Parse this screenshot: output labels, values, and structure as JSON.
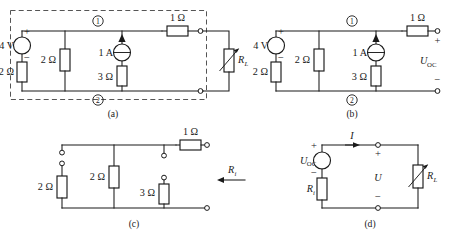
{
  "figure": {
    "caption_a": "(a)",
    "caption_b": "(b)",
    "caption_c": "(c)",
    "caption_d": "(d)",
    "ohm": "Ω"
  },
  "panel_a": {
    "label": "(a)",
    "voltage_source": "4 V",
    "source_plus": "+",
    "source_minus": "−",
    "r_series": "2 Ω",
    "r_mid": "2 Ω",
    "current_source": "1 A",
    "r_cs": "3 Ω",
    "r_out": "1 Ω",
    "node_1": "①",
    "node_2": "②",
    "load": "R",
    "load_sub": "L",
    "dashed_box": "true"
  },
  "panel_b": {
    "label": "(b)",
    "voltage_source": "4 V",
    "source_plus": "+",
    "source_minus": "−",
    "r_series": "2 Ω",
    "r_mid": "2 Ω",
    "current_source": "1 A",
    "r_cs": "3 Ω",
    "r_out": "1 Ω",
    "node_1": "①",
    "node_2": "②",
    "term_plus": "+",
    "term_minus": "−",
    "uoc": "U",
    "uoc_sub": "OC"
  },
  "panel_c": {
    "label": "(c)",
    "r_left": "2 Ω",
    "r_mid": "2 Ω",
    "r_cs": "3 Ω",
    "r_out": "1 Ω",
    "ri": "R",
    "ri_sub": "i",
    "arrow_direction": "left"
  },
  "panel_d": {
    "label": "(d)",
    "uoc": "U",
    "uoc_sub": "OC",
    "source_plus": "+",
    "source_minus": "−",
    "ri": "R",
    "ri_sub": "i",
    "current": "I",
    "term_plus": "+",
    "term_minus": "−",
    "voltage": "U",
    "load": "R",
    "load_sub": "L"
  },
  "colors": {
    "ink": "#1a1a1a",
    "dash": "#555555",
    "paper": "#ffffff"
  }
}
